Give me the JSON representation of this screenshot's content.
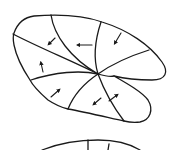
{
  "diagram": {
    "colors": {
      "stroke": "#1a1a1a",
      "background": "#ffffff"
    },
    "center": {
      "x": 98,
      "y": 74
    },
    "sectors": [
      {
        "id": "upper-left",
        "arrow_direction": "down-left"
      },
      {
        "id": "upper-mid",
        "arrow_direction": "left"
      },
      {
        "id": "upper-right",
        "arrow_direction": "down-left"
      },
      {
        "id": "mid-left",
        "arrow_direction": "up"
      },
      {
        "id": "lower-left",
        "arrow_direction": "up-right"
      },
      {
        "id": "lower-mid",
        "arrow_direction": "down-left"
      },
      {
        "id": "lower-right",
        "arrow_direction": "up-right"
      },
      {
        "id": "right",
        "arrow_direction": "none"
      }
    ],
    "second_shape": {
      "visible": "partial",
      "position": "bottom"
    }
  }
}
